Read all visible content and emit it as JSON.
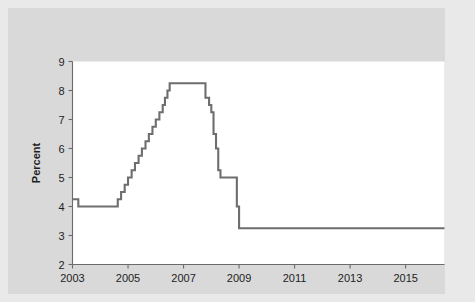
{
  "figure": {
    "background_color": "#d9d9d9",
    "outer_color": "#e9e9e9",
    "plot_background": "#ffffff"
  },
  "chart_data": {
    "type": "line",
    "title": "",
    "subtitle": "",
    "xlabel": "",
    "ylabel": "Percent",
    "xlim": [
      2003.0,
      2016.4
    ],
    "ylim": [
      2,
      9
    ],
    "grid": false,
    "legend": null,
    "line_color": "#6e6e6e",
    "xticks": [
      2003,
      2005,
      2007,
      2009,
      2011,
      2013,
      2015
    ],
    "xtick_labels": [
      "2003",
      "2005",
      "2007",
      "2009",
      "2011",
      "2013",
      "2015"
    ],
    "yticks": [
      2,
      3,
      4,
      5,
      6,
      7,
      8,
      9
    ],
    "ytick_labels": [
      "2",
      "3",
      "4",
      "5",
      "6",
      "7",
      "8",
      "9"
    ],
    "series": [
      {
        "name": "Bank prime loan rate",
        "step": "post",
        "x": [
          2003.0,
          2003.21,
          2004.5,
          2004.63,
          2004.75,
          2004.88,
          2005.0,
          2005.13,
          2005.25,
          2005.38,
          2005.5,
          2005.63,
          2005.75,
          2005.88,
          2006.0,
          2006.13,
          2006.25,
          2006.33,
          2006.42,
          2006.5,
          2007.67,
          2007.79,
          2007.92,
          2008.0,
          2008.08,
          2008.17,
          2008.25,
          2008.33,
          2008.75,
          2008.92,
          2009.0,
          2016.4
        ],
        "y": [
          4.25,
          4.0,
          4.0,
          4.25,
          4.5,
          4.75,
          5.0,
          5.25,
          5.5,
          5.75,
          6.0,
          6.25,
          6.5,
          6.75,
          7.0,
          7.25,
          7.5,
          7.75,
          8.0,
          8.25,
          8.25,
          7.75,
          7.5,
          7.25,
          6.5,
          6.0,
          5.25,
          5.0,
          5.0,
          4.0,
          3.25,
          3.25
        ]
      }
    ]
  }
}
